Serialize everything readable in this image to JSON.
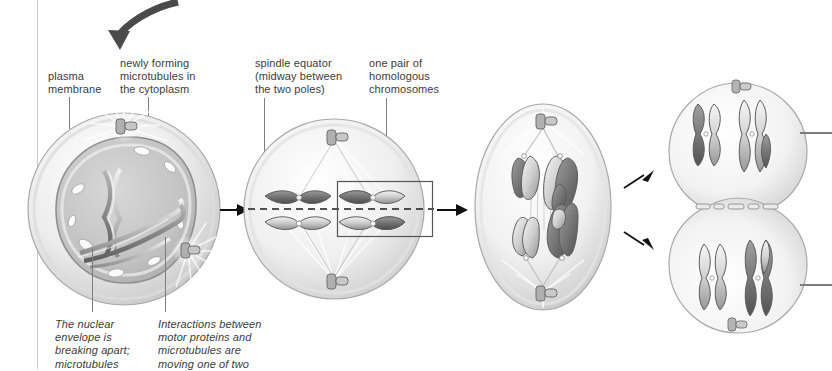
{
  "figure": {
    "background_color": "#ffffff",
    "text_color": "#3b3b3b",
    "leader_color": "#7d7d7d",
    "arrow_color": "#111111",
    "curved_arrow_color": "#4a4a4a"
  },
  "labels": {
    "plasma_membrane": "plasma\nmembrane",
    "newly_forming_microtubules": "newly forming\nmicrotubules in\nthe cytoplasm",
    "spindle_equator": "spindle equator\n(midway between\nthe two poles)",
    "homologous_pair": "one pair of\nhomologous\nchromosomes"
  },
  "captions": {
    "nuclear_envelope": "The nuclear\nenvelope is\nbreaking apart;\nmicrotubules",
    "motor_proteins": "Interactions between\nmotor proteins and\nmicrotubules are\nmoving one of two"
  },
  "cells": [
    {
      "name": "prophase-i-cell",
      "stage": "prophase I",
      "shape": "circle",
      "cx": 124,
      "cy": 209,
      "rx": 96,
      "ry": 96,
      "has_nuclear_envelope": true,
      "centrosomes": 2,
      "chromosomes": 4
    },
    {
      "name": "metaphase-i-cell",
      "stage": "metaphase I",
      "shape": "circle",
      "cx": 334,
      "cy": 209,
      "rx": 91,
      "ry": 91,
      "has_equator_dashed_line": true,
      "highlight_box": {
        "x": 338,
        "y": 182,
        "width": 94,
        "height": 54
      },
      "centrosomes": 2,
      "chromosomes": 4
    },
    {
      "name": "anaphase-i-cell",
      "stage": "anaphase I",
      "shape": "ellipse",
      "cx": 543,
      "cy": 207,
      "rx": 68,
      "ry": 103,
      "centrosomes": 2,
      "chromosomes": 4
    },
    {
      "name": "telophase-i-cells",
      "stage": "telophase I / cytokinesis",
      "shape": "two-daughter-cells",
      "cx": 738,
      "cy": 207,
      "upper_cell": {
        "cx": 738,
        "cy": 152,
        "r": 68
      },
      "lower_cell": {
        "cx": 738,
        "cy": 263,
        "r": 68
      },
      "centrosomes": 2,
      "chromosomes": 4
    }
  ],
  "arrows": [
    {
      "name": "curved-entry-arrow",
      "type": "curved",
      "from": [
        178,
        2
      ],
      "to": [
        113,
        50
      ]
    },
    {
      "name": "stage-arrow-1-2",
      "type": "straight-right",
      "x": 222,
      "y": 209,
      "length": 26
    },
    {
      "name": "stage-arrow-2-3",
      "type": "straight-right",
      "x": 434,
      "y": 209,
      "length": 32
    },
    {
      "name": "split-arrow-upper",
      "type": "diagonal-up-right",
      "x": 626,
      "y": 184,
      "dx": 24,
      "dy": -14
    },
    {
      "name": "split-arrow-lower",
      "type": "diagonal-down-right",
      "x": 626,
      "y": 233,
      "dx": 24,
      "dy": 14
    }
  ],
  "edge_leaders": [
    {
      "name": "right-leader-upper",
      "x": 800,
      "y": 132,
      "length": 32
    },
    {
      "name": "right-leader-lower",
      "x": 800,
      "y": 284,
      "length": 32
    }
  ]
}
